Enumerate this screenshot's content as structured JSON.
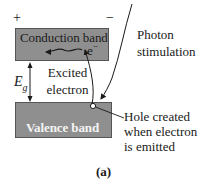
{
  "diagram": {
    "polarity": {
      "positive": "+",
      "negative": "−"
    },
    "conduction_band": {
      "label": "Conduction band",
      "fill": "#8f8f8f",
      "border": "#555555"
    },
    "valence_band": {
      "label": "Valence band",
      "fill": "#8f8f8f",
      "text_color": "#f4f4f4"
    },
    "electron": {
      "symbol": "e",
      "charge": "−"
    },
    "energy_gap": {
      "symbol": "E",
      "subscript": "g"
    },
    "excited_electron": {
      "line1": "Excited",
      "line2": "electron"
    },
    "photon": {
      "line1": "Photon",
      "line2": "stimulation"
    },
    "hole": {
      "line1": "Hole  created",
      "line2": "when electron",
      "line3": "is emitted"
    },
    "caption": "(a)"
  }
}
